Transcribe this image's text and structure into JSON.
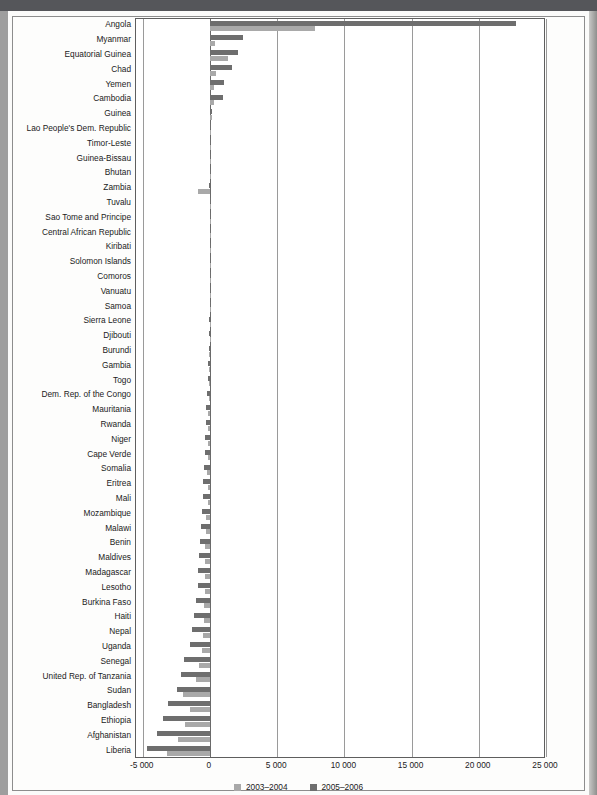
{
  "legend": {
    "series1_label": "2003–2004",
    "series2_label": "2005–2006",
    "series1_color": "#a9a9a9",
    "series2_color": "#6e6e6e"
  },
  "axis": {
    "ticks": [
      "-5 000",
      "0",
      "5 000",
      "10 000",
      "15 000",
      "20 000",
      "25 000"
    ],
    "tick_values": [
      -5000,
      0,
      5000,
      10000,
      15000,
      20000,
      25000
    ]
  },
  "chart_data": {
    "type": "bar",
    "orientation": "horizontal",
    "title": "",
    "subtitle": "",
    "xlabel": "",
    "ylabel": "",
    "xlim": [
      -5500,
      25000
    ],
    "grid": true,
    "legend_position": "bottom",
    "categories": [
      "Angola",
      "Myanmar",
      "Equatorial Guinea",
      "Chad",
      "Yemen",
      "Cambodia",
      "Guinea",
      "Lao People's Dem. Republic",
      "Timor-Leste",
      "Guinea-Bissau",
      "Bhutan",
      "Zambia",
      "Tuvalu",
      "Sao Tome and Principe",
      "Central African Republic",
      "Kiribati",
      "Solomon Islands",
      "Comoros",
      "Vanuatu",
      "Samoa",
      "Sierra Leone",
      "Djibouti",
      "Burundi",
      "Gambia",
      "Togo",
      "Dem. Rep. of the Congo",
      "Mauritania",
      "Rwanda",
      "Niger",
      "Cape Verde",
      "Somalia",
      "Eritrea",
      "Mali",
      "Mozambique",
      "Malawi",
      "Benin",
      "Maldives",
      "Madagascar",
      "Lesotho",
      "Burkina Faso",
      "Haiti",
      "Nepal",
      "Uganda",
      "Senegal",
      "United Rep. of Tanzania",
      "Sudan",
      "Bangladesh",
      "Ethiopia",
      "Afghanistan",
      "Liberia"
    ],
    "series": [
      {
        "name": "2003–2004",
        "color": "#a9a9a9",
        "values": [
          7800,
          400,
          1350,
          420,
          330,
          330,
          120,
          60,
          55,
          40,
          40,
          -900,
          10,
          10,
          10,
          10,
          10,
          10,
          10,
          10,
          -30,
          -30,
          -40,
          -60,
          -60,
          -70,
          -160,
          -110,
          -130,
          -160,
          -210,
          -160,
          -180,
          -280,
          -300,
          -330,
          -330,
          -370,
          -370,
          -420,
          -460,
          -520,
          -560,
          -820,
          -1000,
          -2000,
          -1450,
          -1850,
          -2400,
          -3200
        ]
      },
      {
        "name": "2005–2006",
        "color": "#6e6e6e",
        "values": [
          22800,
          2450,
          2100,
          1650,
          1050,
          1000,
          180,
          110,
          110,
          80,
          80,
          -60,
          20,
          20,
          20,
          20,
          20,
          20,
          20,
          20,
          -60,
          -80,
          -100,
          -160,
          -180,
          -200,
          -280,
          -320,
          -360,
          -400,
          -420,
          -500,
          -540,
          -620,
          -680,
          -760,
          -800,
          -900,
          -900,
          -1000,
          -1150,
          -1350,
          -1500,
          -1900,
          -2150,
          -2450,
          -3100,
          -3500,
          -3950,
          -4700
        ]
      }
    ]
  }
}
